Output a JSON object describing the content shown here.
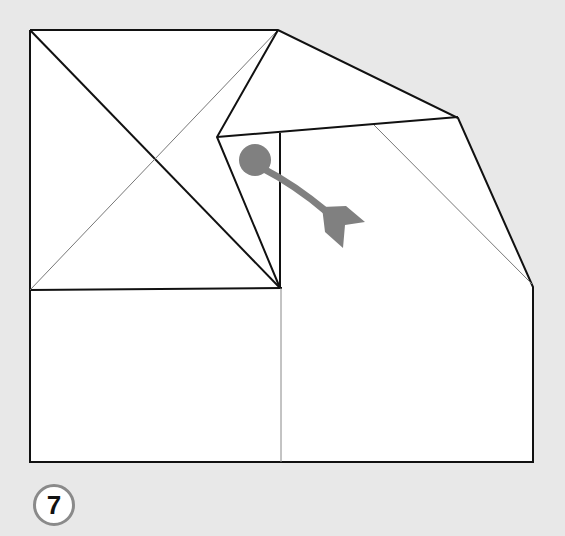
{
  "diagram": {
    "type": "origami-fold-step",
    "step_number": "7",
    "colors": {
      "background": "#e8e8e8",
      "paper": "#ffffff",
      "edge": "#111111",
      "crease": "#888888",
      "arrow": "#808080",
      "badge_border": "#8a8a8a"
    },
    "elements": [
      "square-flap-with-diagonals",
      "folded-top-flap",
      "lower-base-rectangle",
      "curved-arrow-with-dot"
    ]
  }
}
